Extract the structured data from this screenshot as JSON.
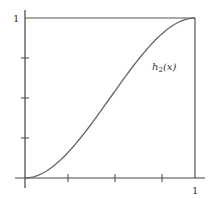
{
  "chart_data": {
    "type": "line",
    "title": "",
    "xlabel": "",
    "ylabel": "",
    "xlim": [
      0,
      1
    ],
    "ylim": [
      0,
      1
    ],
    "grid": false,
    "x_ticks": [
      0,
      0.25,
      0.5,
      0.75,
      1
    ],
    "x_tick_labels": [
      "",
      "",
      "",
      "",
      "1"
    ],
    "y_ticks": [
      0,
      0.25,
      0.5,
      0.75,
      1
    ],
    "y_tick_labels": [
      "",
      "",
      "",
      "",
      "1"
    ],
    "series": [
      {
        "name": "h_2(x)",
        "label": "h₂(x)",
        "x": [
          0,
          0.1,
          0.2,
          0.3,
          0.4,
          0.5,
          0.6,
          0.7,
          0.8,
          0.9,
          1.0
        ],
        "values": [
          0,
          0.028,
          0.104,
          0.216,
          0.352,
          0.5,
          0.648,
          0.784,
          0.896,
          0.972,
          1.0
        ]
      }
    ],
    "annotations": [
      {
        "text": "h₂(x)",
        "x": 0.78,
        "y": 0.72
      }
    ],
    "reference_lines": [
      {
        "type": "horizontal",
        "y": 1,
        "x_range": [
          0,
          1
        ]
      },
      {
        "type": "vertical",
        "x": 1,
        "y_range": [
          0,
          1
        ]
      }
    ]
  },
  "labels": {
    "y_top": "1",
    "x_right": "1",
    "curve": "h",
    "curve_sub": "2",
    "curve_arg": "(x)"
  },
  "colors": {
    "axis": "#444444",
    "curve": "#666666",
    "frame": "#555555",
    "text": "#333333"
  }
}
